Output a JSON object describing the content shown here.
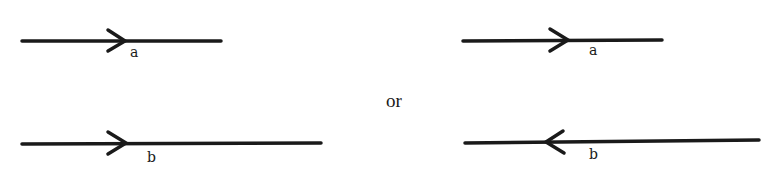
{
  "diagram": {
    "separator_label": "or",
    "stroke_color": "#1a1a1a",
    "left_pair": {
      "vector_a": {
        "label": "a",
        "direction": "right",
        "x1": 22,
        "x2": 221,
        "y": 41,
        "arrow_tip_x": 125
      },
      "vector_b": {
        "label": "b",
        "direction": "right",
        "x1": 22,
        "x2": 321,
        "y": 144,
        "arrow_tip_x": 126
      }
    },
    "right_pair": {
      "vector_a": {
        "label": "a",
        "direction": "right",
        "x1": 463,
        "x2": 662,
        "y": 40,
        "arrow_tip_x": 568
      },
      "vector_b": {
        "label": "b",
        "direction": "left",
        "x1": 465,
        "x2": 759,
        "y": 142,
        "arrow_tip_x": 546
      }
    }
  }
}
